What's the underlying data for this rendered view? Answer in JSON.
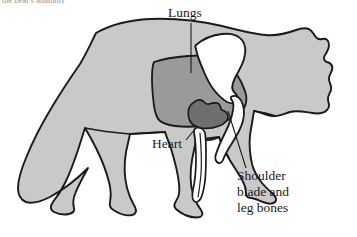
{
  "figure": {
    "cutoff_caption": "the bear's anatomy",
    "colors": {
      "body_fill": "#c9c9c9",
      "lung_fill": "#9a9a9a",
      "heart_fill": "#6f6f6f",
      "bone_fill": "#ffffff",
      "outline": "#1a1a1a",
      "background": "#ffffff",
      "text": "#1a1a1a"
    },
    "labels": [
      {
        "id": "lungs",
        "text": "Lungs"
      },
      {
        "id": "heart",
        "text": "Heart"
      },
      {
        "id": "shoulder",
        "text": "Shoulder\nblade and\nleg bones"
      }
    ]
  }
}
